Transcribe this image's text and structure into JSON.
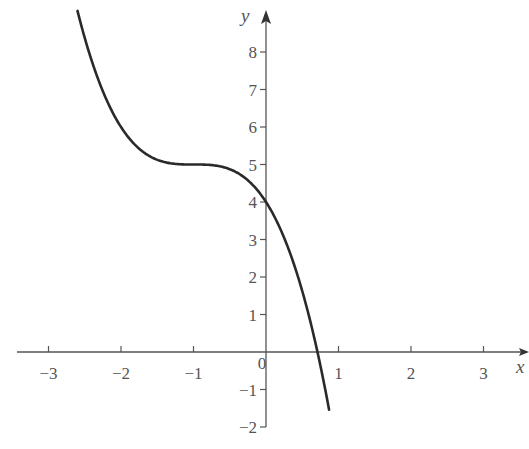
{
  "chart_data": {
    "type": "line",
    "title": "",
    "xlabel": "x",
    "ylabel": "y",
    "xlim": [
      -3.4,
      3.6
    ],
    "ylim": [
      -2,
      9.2
    ],
    "grid": false,
    "legend": null,
    "x_ticks": [
      -3,
      -2,
      -1,
      0,
      1,
      2,
      3
    ],
    "x_tick_labels": [
      "−3",
      "−2",
      "−1",
      "0",
      "1",
      "2",
      "3"
    ],
    "y_ticks": [
      -2,
      -1,
      1,
      2,
      3,
      4,
      5,
      6,
      7,
      8
    ],
    "y_tick_labels": [
      "−2",
      "−1",
      "1",
      "2",
      "3",
      "4",
      "5",
      "6",
      "7",
      "8"
    ],
    "series": [
      {
        "name": "y = 5 − (x + 1)^3",
        "x": [
          -2.6,
          -2.4,
          -2.2,
          -2.0,
          -1.8,
          -1.6,
          -1.4,
          -1.2,
          -1.0,
          -0.8,
          -0.6,
          -0.4,
          -0.2,
          0.0,
          0.2,
          0.4,
          0.6,
          0.71,
          0.8,
          0.87
        ],
        "y": [
          9.1,
          7.74,
          6.73,
          6.0,
          5.51,
          5.22,
          5.06,
          5.01,
          5.0,
          4.99,
          4.94,
          4.78,
          4.49,
          4.0,
          3.27,
          2.26,
          0.9,
          0.0,
          -0.83,
          -1.54
        ]
      }
    ],
    "annotations": []
  },
  "axes": {
    "x_label": "x",
    "y_label": "y",
    "origin_label": "0"
  }
}
